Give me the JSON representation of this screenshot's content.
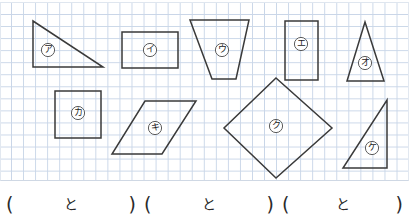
{
  "worksheet": {
    "title": "Shape matching worksheet",
    "grid": {
      "cell_size_px": 12,
      "line_color": "#c9d6e8",
      "background": "#ffffff"
    },
    "shape_stroke_color": "#3a3a3a",
    "shapes": [
      {
        "id": "shape-a",
        "label": "ア",
        "kind": "right-triangle",
        "points": "33,21 33,67 103,67",
        "label_x": 48,
        "label_y": 50
      },
      {
        "id": "shape-i",
        "label": "イ",
        "kind": "rectangle",
        "points": "122,32 178,32 178,68 122,68",
        "label_x": 150,
        "label_y": 50
      },
      {
        "id": "shape-u",
        "label": "ウ",
        "kind": "parallelogram",
        "points": "190,20 249,20 236,79 212,79",
        "label_x": 222,
        "label_y": 50
      },
      {
        "id": "shape-e",
        "label": "エ",
        "kind": "rectangle",
        "points": "285,21 318,21 318,80 285,80",
        "label_x": 301,
        "label_y": 44
      },
      {
        "id": "shape-o",
        "label": "オ",
        "kind": "isosceles-triangle",
        "points": "365,22 384,81 347,81",
        "label_x": 365,
        "label_y": 63
      },
      {
        "id": "shape-ka",
        "label": "カ",
        "kind": "square",
        "points": "55,91 101,91 101,138 55,138",
        "label_x": 78,
        "label_y": 113
      },
      {
        "id": "shape-ki",
        "label": "キ",
        "kind": "parallelogram",
        "points": "145,101 196,101 162,154 112,154",
        "label_x": 155,
        "label_y": 128
      },
      {
        "id": "shape-ku",
        "label": "ク",
        "kind": "rhombus",
        "points": "276,78 332,128 276,178 224,128",
        "label_x": 276,
        "label_y": 126
      },
      {
        "id": "shape-ke",
        "label": "ケ",
        "kind": "right-triangle",
        "points": "387,100 387,168 343,168",
        "label_x": 372,
        "label_y": 148
      }
    ],
    "answer_row": {
      "blanks": [
        {
          "id": "answer-blank-1",
          "open": "(",
          "conjunction": "と",
          "close": ")"
        },
        {
          "id": "answer-blank-2",
          "open": "(",
          "conjunction": "と",
          "close": ")"
        },
        {
          "id": "answer-blank-3",
          "open": "(",
          "conjunction": "と",
          "close": ")"
        }
      ]
    }
  }
}
